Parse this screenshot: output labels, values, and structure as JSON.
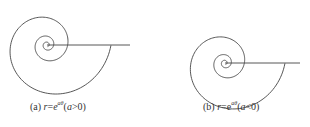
{
  "figures": [
    {
      "id": "a",
      "caption": {
        "label": "(a)",
        "lhs": "r",
        "eq": "=",
        "base": "e",
        "exp": "aθ",
        "cond_open": "(",
        "cond_var": "a",
        "cond_op": ">",
        "cond_val": "0",
        "cond_close": ")"
      },
      "spiral": {
        "cx": 47,
        "cy": 45,
        "a": 0.18,
        "r_end": 64,
        "theta_turns": 3.2,
        "direction": "growing"
      },
      "axis_line": {
        "x1": 47,
        "y1": 45,
        "x2": 130,
        "y2": 45
      }
    },
    {
      "id": "b",
      "caption": {
        "label": "(b)",
        "lhs": "r",
        "eq": "=",
        "base": "e",
        "exp": "aθ",
        "cond_open": "(",
        "cond_var": "a",
        "cond_op": "<",
        "cond_val": "0",
        "cond_close": ")"
      },
      "spiral": {
        "cx": 225,
        "cy": 63,
        "a": -0.18,
        "r_end": 60,
        "theta_turns": 3.2,
        "direction": "shrinking"
      },
      "axis_line": {
        "x1": 225,
        "y1": 63,
        "x2": 300,
        "y2": 63
      }
    }
  ],
  "colors": {
    "stroke": "#444444",
    "text": "#333333"
  }
}
